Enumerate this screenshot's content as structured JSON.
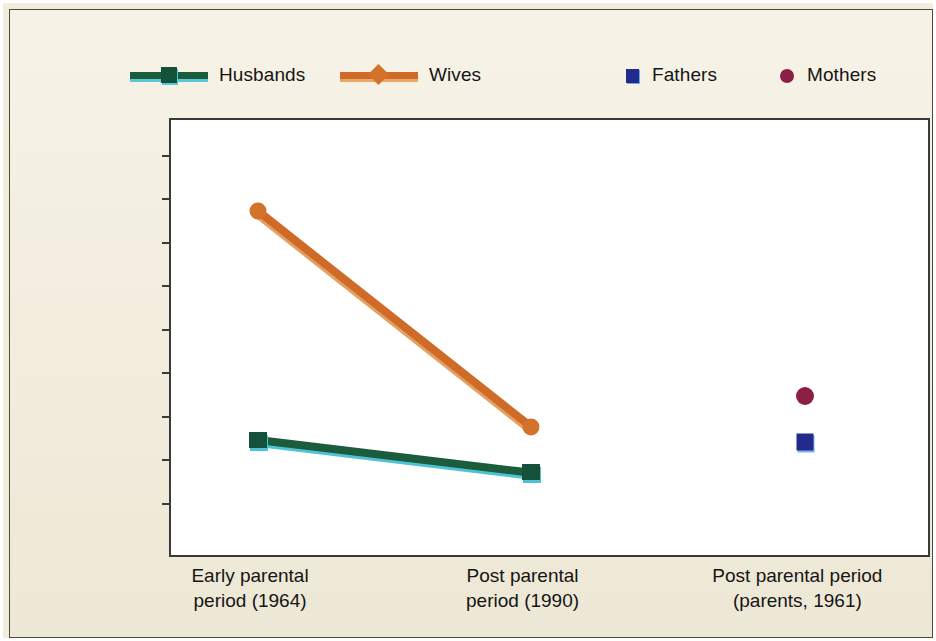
{
  "chart_data": {
    "type": "line",
    "title": "",
    "xlabel": "",
    "ylabel": "Mean Emotional Dependence Score",
    "ylim": [
      40,
      60
    ],
    "ytick_step": 2,
    "yticks": [
      60,
      58,
      56,
      54,
      52,
      50,
      48,
      46,
      44,
      42,
      40
    ],
    "grid": false,
    "legend_position": "top",
    "categories": [
      "Early parental\nperiod (1964)",
      "Post parental\nperiod (1990)",
      "Post parental period\n(parents, 1961)"
    ],
    "series": [
      {
        "name": "Husbands",
        "type": "line",
        "color": "#1b5c3d",
        "marker": "square",
        "x": [
          "Early parental\nperiod (1964)",
          "Post parental\nperiod (1990)"
        ],
        "values": [
          45.3,
          43.8
        ]
      },
      {
        "name": "Wives",
        "type": "line",
        "color": "#cf6a27",
        "marker": "circle",
        "x": [
          "Early parental\nperiod (1964)",
          "Post parental\nperiod (1990)"
        ],
        "values": [
          55.8,
          45.9
        ]
      },
      {
        "name": "Fathers",
        "type": "point",
        "color": "#232a8e",
        "marker": "square",
        "x": [
          "Post parental period\n(parents, 1961)"
        ],
        "values": [
          45.2
        ]
      },
      {
        "name": "Mothers",
        "type": "point",
        "color": "#8c1f45",
        "marker": "circle",
        "x": [
          "Post parental period\n(parents, 1961)"
        ],
        "values": [
          47.3
        ]
      }
    ]
  },
  "legend": {
    "items": [
      {
        "label": "Husbands"
      },
      {
        "label": "Wives"
      },
      {
        "label": "Fathers"
      },
      {
        "label": "Mothers"
      }
    ]
  },
  "axis": {
    "y_title": "Mean Emotional Dependence Score",
    "y_tick_labels": [
      "60",
      "58",
      "56",
      "54",
      "52",
      "50",
      "48",
      "46",
      "44",
      "42",
      "40"
    ],
    "x_tick_labels": [
      "Early parental\nperiod (1964)",
      "Post parental\nperiod (1990)",
      "Post parental period\n(parents, 1961)"
    ]
  },
  "colors": {
    "background": "#f2ecd9",
    "plot_background": "#ffffff",
    "axis": "#3a3a38",
    "husbands": "#1b5c3d",
    "wives": "#cf6a27",
    "fathers": "#232a8e",
    "mothers": "#8c1f45"
  }
}
